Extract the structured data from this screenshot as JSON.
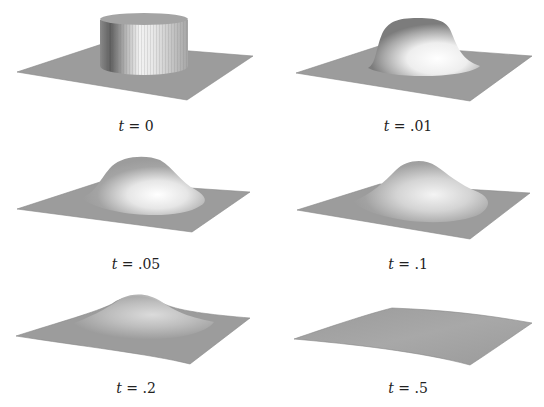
{
  "figure": {
    "panels": [
      {
        "id": "p0",
        "label_var": "t",
        "label_eq": " = ",
        "label_val": "0",
        "shape": "cylinder"
      },
      {
        "id": "p1",
        "label_var": "t",
        "label_eq": " = ",
        "label_val": ".01",
        "shape": "flat-top bump"
      },
      {
        "id": "p2",
        "label_var": "t",
        "label_eq": " = ",
        "label_val": ".05",
        "shape": "round bump"
      },
      {
        "id": "p3",
        "label_var": "t",
        "label_eq": " = ",
        "label_val": ".1",
        "shape": "lower bump"
      },
      {
        "id": "p4",
        "label_var": "t",
        "label_eq": " = ",
        "label_val": ".2",
        "shape": "gentle bump"
      },
      {
        "id": "p5",
        "label_var": "t",
        "label_eq": " = ",
        "label_val": ".5",
        "shape": "nearly flat"
      }
    ],
    "colors": {
      "plane": "#9a9a9a",
      "plane_edge": "#808080",
      "highlight": "#f4f4f4",
      "shadow": "#6e6e6e",
      "text": "#222222"
    }
  }
}
